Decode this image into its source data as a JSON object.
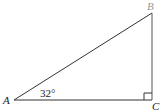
{
  "diagram": {
    "type": "right-triangle",
    "vertices": {
      "A": {
        "label": "A",
        "x": 14,
        "y": 100
      },
      "B": {
        "label": "B",
        "x": 152,
        "y": 13
      },
      "C": {
        "label": "C",
        "x": 152,
        "y": 100
      }
    },
    "angle_A_label": "32°",
    "right_angle_at": "C",
    "colors": {
      "line": "#333333",
      "label": "#222222",
      "label_B": "#9a9a9a"
    }
  }
}
